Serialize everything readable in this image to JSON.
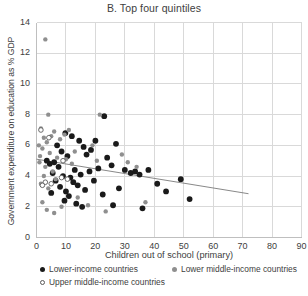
{
  "chart_data": {
    "type": "scatter",
    "title": "B. Top four quintiles",
    "xlabel": "Children out of school (primary)",
    "ylabel": "Government expenditure on education as % GDP",
    "xlim": [
      0,
      90
    ],
    "ylim": [
      0,
      14
    ],
    "xticks": [
      0,
      10,
      20,
      30,
      40,
      50,
      60,
      70,
      80,
      90
    ],
    "yticks": [
      0,
      2,
      4,
      6,
      8,
      10,
      12,
      14
    ],
    "grid": true,
    "legend_position": "below",
    "colors": {
      "lower_income": "#1a1a1a",
      "lower_middle_income": "#8f8f8f",
      "upper_middle_income": "#ffffff",
      "upper_middle_income_edge": "#5a5a5a",
      "trendline": "#7a7a7a",
      "gridline": "#d9d9d9",
      "axis": "#bfbfbf",
      "text": "#404040"
    },
    "trendline": {
      "visible": true,
      "x_start": 0,
      "y_start": 5.1,
      "x_end": 72,
      "y_end": 2.85
    },
    "series": [
      {
        "name": "Lower-income countries",
        "marker": "filled-circle",
        "color": "#1a1a1a",
        "points": [
          [
            8.5,
            5.6
          ],
          [
            10.5,
            5.3
          ],
          [
            6.0,
            4.9
          ],
          [
            7.5,
            4.6
          ],
          [
            5.5,
            4.2
          ],
          [
            9.0,
            4.0
          ],
          [
            11.5,
            3.9
          ],
          [
            12.5,
            3.6
          ],
          [
            8.0,
            3.3
          ],
          [
            10.0,
            3.0
          ],
          [
            11.0,
            2.7
          ],
          [
            9.5,
            2.4
          ],
          [
            13.0,
            4.4
          ],
          [
            15.0,
            4.1
          ],
          [
            14.0,
            3.4
          ],
          [
            16.5,
            3.1
          ],
          [
            18.0,
            4.3
          ],
          [
            17.0,
            5.4
          ],
          [
            19.5,
            3.7
          ],
          [
            21.0,
            4.5
          ],
          [
            22.5,
            2.8
          ],
          [
            24.0,
            5.2
          ],
          [
            25.5,
            4.7
          ],
          [
            20.0,
            6.3
          ],
          [
            23.0,
            7.9
          ],
          [
            26.0,
            2.1
          ],
          [
            28.0,
            3.2
          ],
          [
            30.0,
            4.4
          ],
          [
            32.0,
            4.2
          ],
          [
            33.5,
            4.3
          ],
          [
            35.0,
            4.1
          ],
          [
            38.0,
            4.4
          ],
          [
            36.0,
            1.9
          ],
          [
            41.0,
            3.5
          ],
          [
            44.0,
            3.0
          ],
          [
            12.0,
            6.6
          ],
          [
            14.5,
            6.3
          ],
          [
            16.0,
            5.9
          ],
          [
            18.5,
            5.7
          ],
          [
            7.0,
            6.0
          ],
          [
            9.8,
            6.8
          ],
          [
            4.5,
            4.8
          ],
          [
            6.5,
            3.7
          ],
          [
            5.0,
            2.9
          ],
          [
            13.5,
            2.2
          ],
          [
            15.5,
            2.0
          ],
          [
            3.5,
            5.0
          ],
          [
            49.0,
            3.8
          ],
          [
            52.0,
            2.5
          ],
          [
            27.0,
            6.1
          ]
        ]
      },
      {
        "name": "Lower middle-income countries",
        "marker": "filled-circle-gray",
        "color": "#8f8f8f",
        "points": [
          [
            3.0,
            12.9
          ],
          [
            4.0,
            8.0
          ],
          [
            21.5,
            8.0
          ],
          [
            1.5,
            7.1
          ],
          [
            2.5,
            6.5
          ],
          [
            5.0,
            6.6
          ],
          [
            6.0,
            6.9
          ],
          [
            3.5,
            6.2
          ],
          [
            2.0,
            5.8
          ],
          [
            4.5,
            5.5
          ],
          [
            7.0,
            5.2
          ],
          [
            1.0,
            4.9
          ],
          [
            3.0,
            4.6
          ],
          [
            5.5,
            4.3
          ],
          [
            2.5,
            4.0
          ],
          [
            6.5,
            3.8
          ],
          [
            1.5,
            3.5
          ],
          [
            4.0,
            3.2
          ],
          [
            8.0,
            6.4
          ],
          [
            9.5,
            6.7
          ],
          [
            11.0,
            7.0
          ],
          [
            13.0,
            5.6
          ],
          [
            10.0,
            5.1
          ],
          [
            12.0,
            4.8
          ],
          [
            14.0,
            2.6
          ],
          [
            2.0,
            2.3
          ],
          [
            3.5,
            1.8
          ],
          [
            17.5,
            2.1
          ],
          [
            20.5,
            5.0
          ],
          [
            29.0,
            5.4
          ],
          [
            31.0,
            4.9
          ],
          [
            34.0,
            4.6
          ],
          [
            37.0,
            2.3
          ],
          [
            23.5,
            1.7
          ],
          [
            8.5,
            2.0
          ],
          [
            6.0,
            1.6
          ],
          [
            19.0,
            6.0
          ],
          [
            0.8,
            6.0
          ],
          [
            1.2,
            5.3
          ]
        ]
      },
      {
        "name": "Upper middle-income countries",
        "marker": "open-circle",
        "color": "#ffffff",
        "points": [
          [
            4.2,
            6.5
          ],
          [
            9.0,
            5.0
          ],
          [
            8.5,
            3.9
          ],
          [
            3.0,
            3.6
          ],
          [
            2.0,
            3.4
          ],
          [
            5.0,
            3.5
          ],
          [
            10.5,
            3.8
          ],
          [
            1.5,
            7.0
          ]
        ]
      }
    ]
  },
  "legend": {
    "items": [
      {
        "label": "Lower-income countries",
        "marker": "filled-black-dot"
      },
      {
        "label": "Lower middle-income countries",
        "marker": "filled-gray-dot"
      },
      {
        "label": "Upper middle-income countries",
        "marker": "open-circle-dot"
      }
    ]
  }
}
